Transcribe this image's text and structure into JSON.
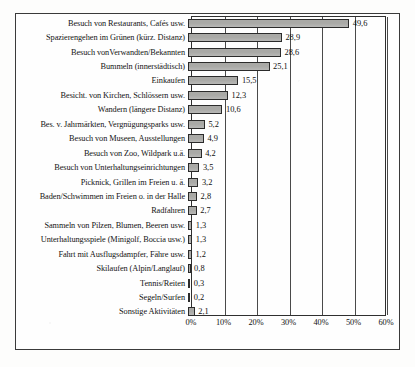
{
  "chart_data": {
    "type": "bar",
    "orientation": "horizontal",
    "title": "",
    "xlabel": "",
    "ylabel": "",
    "xlim": [
      0,
      60
    ],
    "xticks": [
      "0%",
      "10%",
      "20%",
      "30%",
      "40%",
      "50%",
      "60%"
    ],
    "xtick_values": [
      0,
      10,
      20,
      30,
      40,
      50,
      60
    ],
    "grid": true,
    "legend": false,
    "value_format": "comma-decimal",
    "bar_color": "#a9a9a6",
    "bar_border_color": "#2b2b2b",
    "categories": [
      "Besuch von Restaurants, Cafés usw.",
      "Spazierengehen im Grünen (kürz. Distanz)",
      "Besuch vonVerwandten/Bekannten",
      "Bummeln (innerstädtisch)",
      "Einkaufen",
      "Besicht. von Kirchen, Schlössern usw.",
      "Wandern (längere Distanz)",
      "Bes. v. Jahrmärkten, Vergnügungsparks usw.",
      "Besuch von Museen, Ausstellungen",
      "Besuch von Zoo, Wildpark u.ä.",
      "Besuch von Unterhaltungseinrichtungen",
      "Picknick, Grillen im Freien u. ä.",
      "Baden/Schwimmen im Freien o. in der Halle",
      "Radfahren",
      "Sammeln von Pilzen, Blumen, Beeren usw.",
      "Unterhaltungsspiele (Minigolf, Boccia usw.)",
      "Fahrt mit Ausflugsdampfer, Fähre usw.",
      "Skilaufen (Alpin/Langlauf)",
      "Tennis/Reiten",
      "Segeln/Surfen",
      "Sonstige Aktivitäten"
    ],
    "values": [
      49.6,
      28.9,
      28.6,
      25.1,
      15.5,
      12.3,
      10.6,
      5.2,
      4.9,
      4.2,
      3.5,
      3.2,
      2.8,
      2.7,
      1.3,
      1.3,
      1.2,
      0.8,
      0.3,
      0.2,
      2.1
    ],
    "value_labels": [
      "49,6",
      "28,9",
      "28,6",
      "25,1",
      "15,5",
      "12,3",
      "10,6",
      "5,2",
      "4,9",
      "4,2",
      "3,5",
      "3,2",
      "2,8",
      "2,7",
      "1,3",
      "1,3",
      "1,2",
      "0,8",
      "0,3",
      "0,2",
      "2,1"
    ]
  }
}
